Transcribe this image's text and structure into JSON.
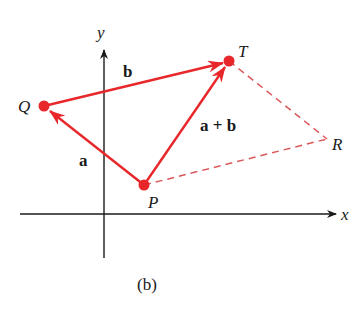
{
  "diagram": {
    "caption": "(b)",
    "axes": {
      "x_label": "x",
      "y_label": "y"
    },
    "points": {
      "P": "P",
      "Q": "Q",
      "T": "T",
      "R": "R"
    },
    "vectors": {
      "a": "a",
      "b": "b",
      "sum": "a + b"
    },
    "colors": {
      "vector": "#e8272a",
      "dashed": "#d9585a",
      "axis": "#1a1a1a"
    }
  }
}
